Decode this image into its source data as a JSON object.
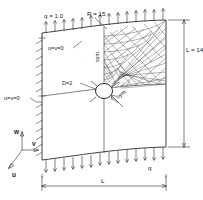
{
  "figure": {
    "kind": "engineering-diagram",
    "background_color": "#ffffff",
    "line_color": "#2b2b2b"
  },
  "labels": {
    "radius": "R = 15",
    "load_top": "q = 1.0",
    "load_bottom": "q",
    "bc_top": "u=v=0",
    "bc_left": "u=v=0",
    "hole_diameter": "D=2",
    "sym_vertical": "sym.",
    "sym_diagonal": "sym.",
    "length_vertical": "L = 14",
    "length_horizontal": "L"
  },
  "axes": {
    "w": "w",
    "v": "v",
    "u": "u"
  },
  "mesh": {
    "element_type": "triangular",
    "location": "upper-right quadrant",
    "refinement": "graded, finest at hole boundary"
  },
  "loads": {
    "top_edge_arrow_count": 13,
    "bottom_edge_arrow_count": 13,
    "direction": "outward normal to curved edges"
  },
  "boundary": {
    "left_edge": "hatched / clamped",
    "bottom_edge_tick_marks": true
  }
}
